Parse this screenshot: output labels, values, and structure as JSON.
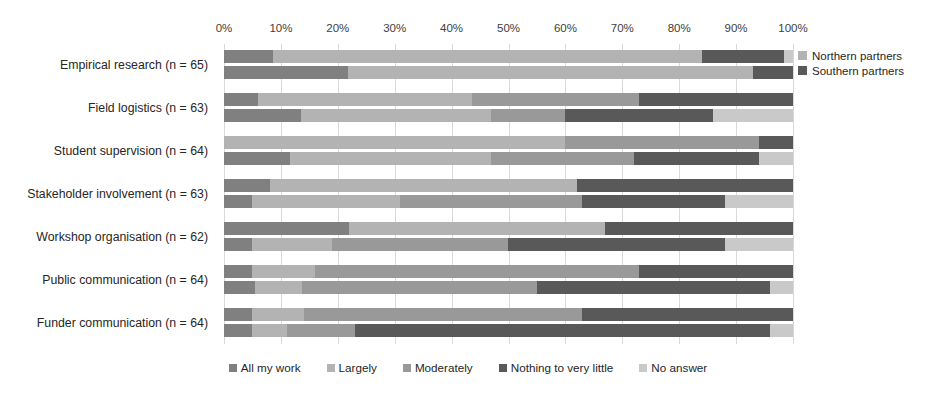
{
  "chart_data": {
    "type": "bar",
    "subtype": "stacked-bar-100-horizontal-grouped",
    "title": "",
    "xlabel": "",
    "ylabel": "",
    "xlim": [
      0,
      100
    ],
    "grid": true,
    "orientation": "horizontal",
    "stacked": true,
    "normalized_percent": true,
    "legend_position": "bottom",
    "xticks": [
      "0%",
      "10%",
      "20%",
      "30%",
      "40%",
      "50%",
      "60%",
      "70%",
      "80%",
      "90%",
      "100%"
    ],
    "xtick_values": [
      0,
      10,
      20,
      30,
      40,
      50,
      60,
      70,
      80,
      90,
      100
    ],
    "categories": [
      "Empirical research (n = 65)",
      "Field logistics (n = 63)",
      "Student supervision (n = 64)",
      "Stakeholder involvement (n = 63)",
      "Workshop organisation (n = 62)",
      "Public communication (n = 64)",
      "Funder communication (n = 64)"
    ],
    "response_levels": [
      "All my work",
      "Largely",
      "Moderately",
      "Nothing to very little",
      "No answer"
    ],
    "level_colors": [
      "#808080",
      "#b3b3b3",
      "#999999",
      "#595959",
      "#c9c9c9"
    ],
    "groups": [
      {
        "name": "Northern partners",
        "swatch": "#b3b3b3"
      },
      {
        "name": "Southern partners",
        "swatch": "#595959"
      }
    ],
    "series": [
      {
        "name": "Northern partners",
        "values_by_category": [
          [
            8.6,
            75.4,
            0.0,
            14.5,
            1.5
          ],
          [
            6.0,
            37.5,
            29.5,
            27.0,
            0.0
          ],
          [
            0.0,
            60.0,
            34.0,
            6.0,
            0.0
          ],
          [
            8.0,
            54.0,
            0.0,
            38.0,
            0.0
          ],
          [
            22.0,
            45.0,
            0.0,
            33.0,
            0.0
          ],
          [
            5.0,
            11.0,
            57.0,
            27.0,
            0.0
          ],
          [
            5.0,
            9.0,
            49.0,
            37.0,
            0.0
          ]
        ]
      },
      {
        "name": "Southern partners",
        "values_by_category": [
          [
            21.8,
            71.2,
            0.0,
            7.0,
            0.0
          ],
          [
            13.5,
            33.5,
            13.0,
            26.0,
            14.0
          ],
          [
            11.6,
            35.4,
            25.0,
            22.0,
            6.0
          ],
          [
            5.0,
            26.0,
            32.0,
            25.0,
            12.0
          ],
          [
            5.0,
            14.0,
            31.0,
            38.0,
            12.0
          ],
          [
            5.5,
            8.2,
            41.3,
            41.0,
            4.0
          ],
          [
            5.0,
            6.0,
            12.0,
            73.0,
            4.0
          ]
        ]
      }
    ]
  },
  "side_legend": {
    "items": [
      {
        "label": "Northern partners",
        "color": "#b3b3b3"
      },
      {
        "label": "Southern partners",
        "color": "#595959"
      }
    ]
  },
  "bottom_legend": {
    "items": [
      {
        "label": "All my work",
        "color": "#808080"
      },
      {
        "label": "Largely",
        "color": "#b3b3b3"
      },
      {
        "label": "Moderately",
        "color": "#999999"
      },
      {
        "label": "Nothing to very little",
        "color": "#595959"
      },
      {
        "label": "No answer",
        "color": "#c9c9c9"
      }
    ]
  }
}
